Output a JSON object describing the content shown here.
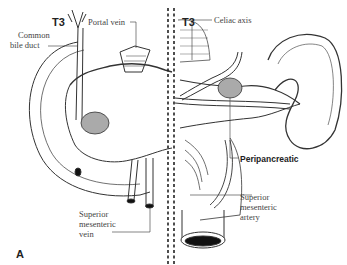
{
  "figure": {
    "panel_label": "A",
    "left_half": {
      "stage_label": "T3",
      "labels": {
        "portal_vein": "Portal vein",
        "common_bile_duct_line1": "Common",
        "common_bile_duct_line2": "bile duct",
        "smv_line1": "Superior",
        "smv_line2": "mesenteric",
        "smv_line3": "vein"
      }
    },
    "right_half": {
      "stage_label": "T3",
      "labels": {
        "celiac_axis": "Celiac axis",
        "peripancreatic": "Peripancreatic",
        "sma_line1": "Superior",
        "sma_line2": "mesenteric",
        "sma_line3": "artery"
      }
    },
    "colors": {
      "line": "#333333",
      "text": "#444444",
      "tumor": "#9a9a9a",
      "lumen": "#111111"
    }
  }
}
